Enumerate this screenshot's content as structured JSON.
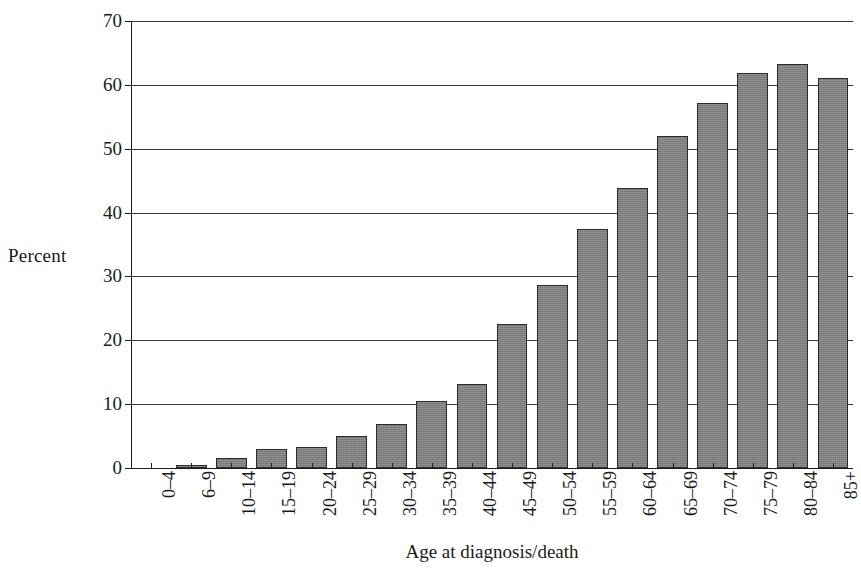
{
  "chart_data": {
    "type": "bar",
    "title": "",
    "xlabel": "Age at diagnosis/death",
    "ylabel": "Percent",
    "ylim": [
      0,
      70
    ],
    "ytick_values": [
      0,
      10,
      20,
      30,
      40,
      50,
      60,
      70
    ],
    "ytick_labels": [
      "0",
      "10",
      "20",
      "30",
      "40",
      "50",
      "60",
      "70"
    ],
    "grid": true,
    "legend": "none",
    "bar_color": "#808080",
    "bar_edge_color": "#2a2a2a",
    "axis_color": "#1d1d1d",
    "categories": [
      "0–4",
      "6–9",
      "10–14",
      "15–19",
      "20–24",
      "25–29",
      "30–34",
      "35–39",
      "40–44",
      "45–49",
      "50–54",
      "55–59",
      "60–64",
      "65–69",
      "70–74",
      "75–79",
      "80–84",
      "85+"
    ],
    "values": [
      0.0,
      0.4,
      1.6,
      2.9,
      3.3,
      5.0,
      6.9,
      10.5,
      13.1,
      22.6,
      28.6,
      37.5,
      43.8,
      52.0,
      57.1,
      61.9,
      63.3,
      61.1
    ]
  }
}
